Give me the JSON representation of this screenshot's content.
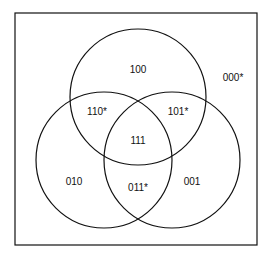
{
  "diagram": {
    "type": "venn-3-set",
    "stroke_color": "#111111",
    "background": "#ffffff",
    "regions": [
      {
        "id": "top-only",
        "label": "100",
        "x": 138,
        "y": 73
      },
      {
        "id": "outside",
        "label": "000*",
        "x": 233,
        "y": 81
      },
      {
        "id": "top-left",
        "label": "110*",
        "x": 97,
        "y": 115
      },
      {
        "id": "top-right",
        "label": "101*",
        "x": 178,
        "y": 115
      },
      {
        "id": "center",
        "label": "111",
        "x": 138,
        "y": 144
      },
      {
        "id": "left-only",
        "label": "010",
        "x": 74,
        "y": 185
      },
      {
        "id": "left-right",
        "label": "011*",
        "x": 138,
        "y": 191
      },
      {
        "id": "right-only",
        "label": "001",
        "x": 192,
        "y": 185
      }
    ]
  }
}
